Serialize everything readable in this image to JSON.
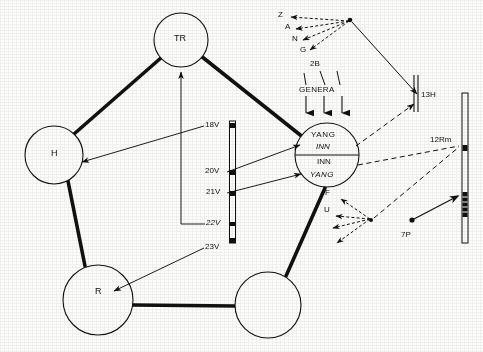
{
  "figure": {
    "kind": "hand-drawn schematic diagram",
    "background_color": "#fdfdfc",
    "ink_color": "#111111"
  },
  "organ_nodes": [
    {
      "id": "tr",
      "label": "TR",
      "cx": 181,
      "cy": 40,
      "r": 27
    },
    {
      "id": "h",
      "label": "H",
      "cx": 54,
      "cy": 155,
      "r": 29
    },
    {
      "id": "r",
      "label": "R",
      "cx": 98,
      "cy": 300,
      "r": 35
    },
    {
      "id": "br",
      "label": "",
      "cx": 268,
      "cy": 305,
      "r": 33
    }
  ],
  "split_node": {
    "id": "yang-inn",
    "cx": 327,
    "cy": 155,
    "r": 32,
    "top_line1": "YANG",
    "top_line2": "INN",
    "bottom_line1": "INN",
    "bottom_line2": "YANG"
  },
  "thick_links": [
    {
      "from": "tr",
      "to": "h"
    },
    {
      "from": "tr",
      "to": "yang-inn"
    },
    {
      "from": "h",
      "to": "r"
    },
    {
      "from": "r",
      "to": "br"
    },
    {
      "from": "br",
      "to": "yang-inn"
    }
  ],
  "voltage_scale": {
    "x": 232,
    "top": 121,
    "bottom": 243,
    "ticks": [
      {
        "label": "18V",
        "y": 126,
        "italic": false
      },
      {
        "label": "20V",
        "y": 172,
        "italic": false
      },
      {
        "label": "21V",
        "y": 193,
        "italic": false
      },
      {
        "label": "22V",
        "y": 224,
        "italic": true
      },
      {
        "label": "23V",
        "y": 243,
        "italic": false
      }
    ]
  },
  "voltage_arrows": [
    {
      "from_tick": "18V",
      "to_node": "H",
      "style": "solid"
    },
    {
      "from_tick": "20V",
      "to_node": "YANG (upper)",
      "style": "solid"
    },
    {
      "from_tick": "21V",
      "to_node": "YANG (lower)",
      "style": "solid"
    },
    {
      "from_tick": "22V",
      "to_node": "TR",
      "style": "solid-bracket"
    },
    {
      "from_tick": "23V",
      "to_node": "R",
      "style": "solid"
    }
  ],
  "zang_cluster": {
    "hub_x": 350,
    "hub_y": 20,
    "letters": [
      {
        "text": "Z",
        "x": 278,
        "y": 15
      },
      {
        "text": "A",
        "x": 285,
        "y": 27
      },
      {
        "text": "N",
        "x": 292,
        "y": 39
      },
      {
        "text": "G",
        "x": 300,
        "y": 50
      }
    ],
    "arrow_style": "dashed"
  },
  "genera_group": {
    "top_label": "2B",
    "top_label_x": 310,
    "top_label_y": 64,
    "word": "GENERA",
    "word_x": 300,
    "word_y": 92,
    "tick_count": 3,
    "arrow_count": 3
  },
  "fu_cluster": {
    "hub_x": 371,
    "hub_y": 220,
    "letters": [
      {
        "text": "F",
        "x": 325,
        "y": 193
      },
      {
        "text": "U",
        "x": 324,
        "y": 210
      }
    ],
    "arrow_style": "dashed"
  },
  "right_bars": {
    "short_bar": {
      "label": "13H",
      "label_x": 424,
      "label_y": 95,
      "x": 415,
      "top": 75,
      "bottom": 112
    },
    "tall_bar": {
      "x": 465,
      "top": 93,
      "bottom": 243,
      "markers": [
        {
          "label": "12Rm",
          "label_x": 431,
          "label_y": 140,
          "y": 148,
          "type": "square-dot"
        },
        {
          "label": "",
          "label_x": 0,
          "label_y": 0,
          "y": 205,
          "type": "hatched-segment"
        }
      ]
    },
    "point_7p": {
      "label": "7P",
      "label_x": 402,
      "label_y": 235,
      "dot_x": 412,
      "dot_y": 220
    }
  },
  "dashed_links": [
    {
      "from": "yang-inn (upper right)",
      "to": "13H"
    },
    {
      "from": "yang-inn (lower right)",
      "to": "12Rm"
    },
    {
      "from": "fu-hub",
      "to": "12Rm"
    }
  ],
  "solid_links": [
    {
      "from": "zang-hub",
      "to": "13H"
    },
    {
      "from": "7P dot",
      "to": "tall bar hatched segment"
    }
  ]
}
